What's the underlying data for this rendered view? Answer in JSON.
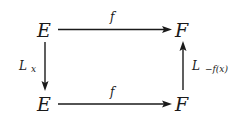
{
  "diagram": {
    "type": "commutative-square",
    "nodes": {
      "top_left": "E",
      "top_right": "F",
      "bottom_left": "E",
      "bottom_right": "F"
    },
    "edges": {
      "top": {
        "from": "E",
        "to": "F",
        "label": "f"
      },
      "bottom": {
        "from": "E",
        "to": "F",
        "label": "f"
      },
      "left": {
        "from": "E (top)",
        "to": "E (bottom)",
        "label_main": "L",
        "label_sub": "x"
      },
      "right": {
        "from": "F (bottom)",
        "to": "F (top)",
        "label_main": "L",
        "label_sub": "−f(x)"
      }
    }
  }
}
